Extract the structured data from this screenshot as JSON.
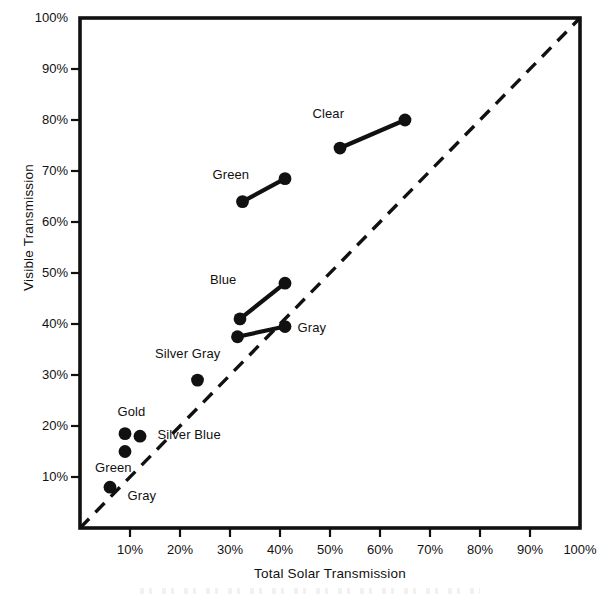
{
  "chart_data": {
    "type": "scatter",
    "title": "",
    "xlabel": "Total Solar Transmission",
    "ylabel": "Visible Transmission",
    "xlim": [
      0,
      100
    ],
    "ylim": [
      0,
      100
    ],
    "grid": false,
    "legend": "none",
    "xticks": [
      "10%",
      "20%",
      "30%",
      "40%",
      "50%",
      "60%",
      "70%",
      "80%",
      "90%",
      "100%"
    ],
    "xtick_values": [
      10,
      20,
      30,
      40,
      50,
      60,
      70,
      80,
      90,
      100
    ],
    "yticks": [
      "10%",
      "20%",
      "30%",
      "40%",
      "50%",
      "60%",
      "70%",
      "80%",
      "90%",
      "100%"
    ],
    "ytick_values": [
      10,
      20,
      30,
      40,
      50,
      60,
      70,
      80,
      90,
      100
    ],
    "reference_line": {
      "name": "diagonal-parity-line",
      "style": "dashed",
      "from": [
        0,
        0
      ],
      "to": [
        100,
        100
      ]
    },
    "series": [
      {
        "name": "Clear",
        "label": "Clear",
        "kind": "segment",
        "points": [
          [
            52,
            74.5
          ],
          [
            65,
            80
          ]
        ],
        "label_position": [
          46.5,
          81
        ]
      },
      {
        "name": "Green",
        "label": "Green",
        "kind": "segment",
        "points": [
          [
            32.5,
            64
          ],
          [
            41,
            68.5
          ]
        ],
        "label_position": [
          26.5,
          69
        ]
      },
      {
        "name": "Blue",
        "label": "Blue",
        "kind": "segment",
        "points": [
          [
            32,
            41
          ],
          [
            41,
            48
          ]
        ],
        "label_position": [
          26,
          48.5
        ]
      },
      {
        "name": "Gray",
        "label": "Gray",
        "kind": "segment",
        "points": [
          [
            31.5,
            37.5
          ],
          [
            41,
            39.5
          ]
        ],
        "label_position": [
          43.5,
          39
        ]
      },
      {
        "name": "Silver Gray",
        "label": "Silver Gray",
        "kind": "point",
        "points": [
          [
            23.5,
            29
          ]
        ],
        "label_position": [
          15,
          34
        ]
      },
      {
        "name": "Gold",
        "label": "Gold",
        "kind": "point",
        "points": [
          [
            9,
            18.5
          ]
        ],
        "label_position": [
          7.5,
          22.5
        ]
      },
      {
        "name": "Silver Blue",
        "label": "Silver Blue",
        "kind": "point",
        "points": [
          [
            12,
            18
          ]
        ],
        "label_position": [
          15.5,
          18
        ]
      },
      {
        "name": "Green (low)",
        "label": "Green",
        "kind": "point",
        "points": [
          [
            9,
            15
          ]
        ],
        "label_position": [
          3,
          11.5
        ]
      },
      {
        "name": "Gray (low)",
        "label": "Gray",
        "kind": "point",
        "points": [
          [
            6,
            8
          ]
        ],
        "label_position": [
          9.5,
          6
        ]
      }
    ],
    "colors": {
      "ink": "#111111",
      "background": "#ffffff",
      "marker": "#111111",
      "reference_line": "#111111"
    }
  }
}
